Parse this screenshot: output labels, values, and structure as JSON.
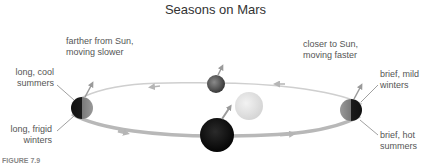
{
  "title": "Seasons on Mars",
  "labels": {
    "top_left": [
      "farther from Sun,",
      "moving slower"
    ],
    "top_right": [
      "closer to Sun,",
      "moving faster"
    ],
    "left_upper": [
      "long, cool",
      "summers"
    ],
    "left_lower": [
      "long, frigid",
      "winters"
    ],
    "right_upper": [
      "brief, mild",
      "winters"
    ],
    "right_lower": [
      "brief, hot",
      "summers"
    ]
  },
  "caption": {
    "figure": "FIGURE 7.9"
  },
  "colors": {
    "sun": "#e0e0e0",
    "planet_dark": "#1a1a1a",
    "planet_lit": "#888888",
    "orbit": "#c8c8c8",
    "arrow": "#9a9a9a"
  }
}
